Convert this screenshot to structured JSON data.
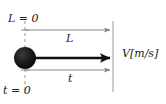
{
  "figure": {
    "background_color": "#ffffff",
    "line_color": "#808080",
    "arrow_color": "#111111",
    "ball_color": "#111111"
  },
  "labels": {
    "origin_length": "L = 0",
    "origin_time": "t = 0",
    "distance": "L",
    "time": "t",
    "velocity": "V[m/s]"
  },
  "elements": {
    "ball_name": "moving-ball",
    "velocity_arrow_name": "velocity-arrow",
    "distance_arrow_name": "distance-measure-arrow",
    "time_arrow_name": "time-measure-arrow",
    "left_reference_name": "left-reference-line",
    "right_reference_name": "right-reference-line"
  },
  "geometry": {
    "left_x": 25,
    "right_x": 113,
    "axis_y": 58,
    "distance_line_y": 30,
    "time_line_y": 70,
    "ball_radius": 11
  }
}
